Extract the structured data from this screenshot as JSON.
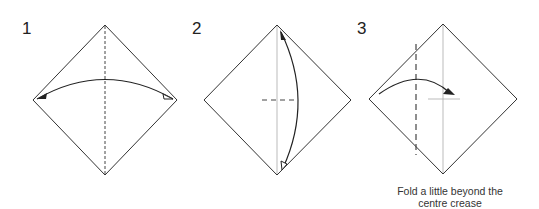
{
  "steps": [
    {
      "number": "1",
      "label_pos": [
        22,
        20
      ],
      "instruction": "Valley fold in half along the vertical diagonal and unfold",
      "arrow": "fold-and-unfold"
    },
    {
      "number": "2",
      "label_pos": [
        192,
        20
      ],
      "instruction": "Fold along the horizontal line and unfold",
      "arrow": "fold-and-unfold"
    },
    {
      "number": "3",
      "label_pos": [
        357,
        20
      ],
      "instruction": "Fold a little beyond the centre crease",
      "arrow": "fold"
    }
  ],
  "caption": {
    "line1": "Fold a little beyond the",
    "line2": "centre crease"
  },
  "colors": {
    "outline": "#333333",
    "crease": "#aaaaaa",
    "dash": "#444444",
    "background": "#ffffff"
  }
}
